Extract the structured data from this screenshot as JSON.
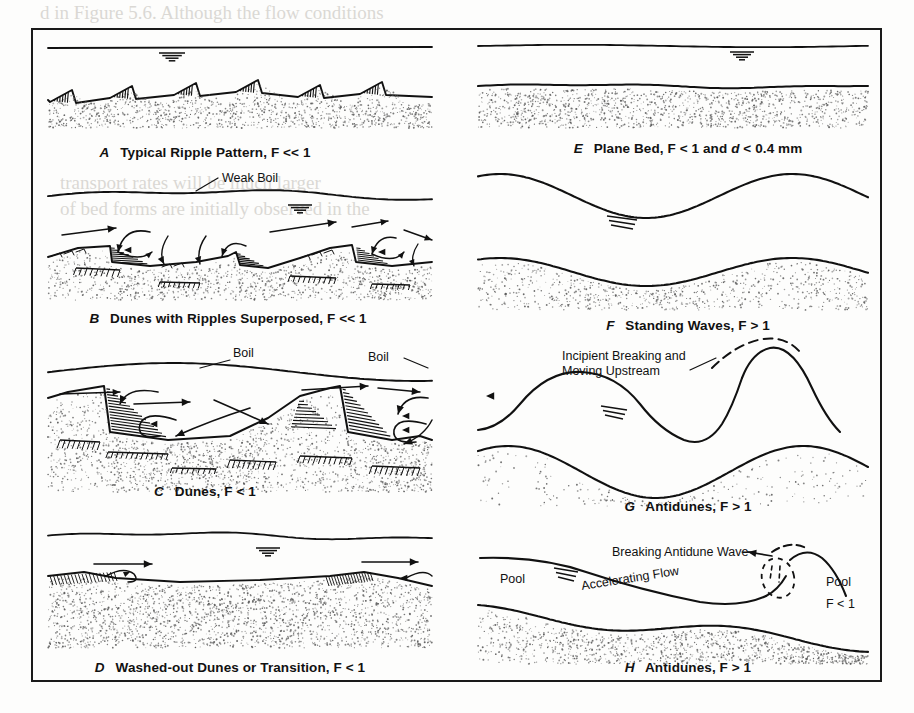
{
  "figure": {
    "panels": [
      {
        "id": "A",
        "label": "A",
        "caption": "Typical Ripple Pattern, F << 1",
        "annotations": []
      },
      {
        "id": "B",
        "label": "B",
        "caption": "Dunes with Ripples Superposed, F << 1",
        "annotations": [
          "Weak Boil"
        ]
      },
      {
        "id": "C",
        "label": "C",
        "caption": "Dunes, F < 1",
        "annotations": [
          "Boil",
          "Boil"
        ]
      },
      {
        "id": "D",
        "label": "D",
        "caption": "Washed-out Dunes or Transition, F < 1",
        "annotations": []
      },
      {
        "id": "E",
        "label": "E",
        "caption_pre": "Plane Bed, F < 1 and ",
        "caption_italic": "d",
        "caption_post": " < 0.4 mm",
        "caption": "Plane Bed, F < 1 and d < 0.4 mm",
        "annotations": []
      },
      {
        "id": "F",
        "label": "F",
        "caption": "Standing Waves, F > 1",
        "annotations": []
      },
      {
        "id": "G",
        "label": "G",
        "caption": "Antidunes, F > 1",
        "annotations": [
          "Incipient Breaking and",
          "Moving Upstream"
        ]
      },
      {
        "id": "H",
        "label": "H",
        "caption": "Antidunes, F > 1",
        "annotations": [
          "Breaking Antidune Wave",
          "Accelerating Flow",
          "Pool",
          "Pool",
          "F < 1"
        ]
      }
    ]
  },
  "colors": {
    "ink": "#111111",
    "sediment_stipple": "#5b5b5b",
    "frame": "#1a1a1a",
    "background": "#fdfdfc"
  },
  "bleed_through": [
    "d in Figure 5.6. Although the flow conditions",
    "in particular periods are uniform, sediment",
    "transport rates will be much larger",
    "of bed forms are initially observed in the",
    "from Quade, A., and others (1990)."
  ]
}
